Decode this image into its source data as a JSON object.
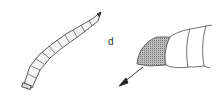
{
  "figure": {
    "panel_label": "d",
    "panels": [
      {
        "name": "larva-whole-body",
        "description": "segmented elongate larva, diagonal"
      },
      {
        "name": "larva-posterior-detail",
        "description": "terminal segment shaded, arrow pointing down-left"
      }
    ],
    "colors": {
      "stroke": "#333333",
      "shade": "#9a9a9a",
      "background": "#ffffff"
    }
  }
}
